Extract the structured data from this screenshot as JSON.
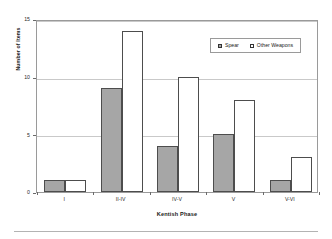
{
  "chart_data": {
    "type": "bar",
    "title": "",
    "xlabel": "Kentish Phase",
    "ylabel": "Number of Items",
    "categories": [
      "I",
      "II-IV",
      "IV-V",
      "V",
      "V-VI"
    ],
    "series": [
      {
        "name": "Spear",
        "values": [
          1,
          9,
          4,
          5,
          1
        ],
        "color": "#a6a6a6"
      },
      {
        "name": "Other Weapons",
        "values": [
          1,
          14,
          10,
          8,
          3
        ],
        "color": "#ffffff"
      }
    ],
    "ylim": [
      0,
      15
    ],
    "yticks": [
      0,
      5,
      10,
      15
    ],
    "ytick_labels": [
      "0",
      "5",
      "10",
      "15"
    ],
    "grid": true,
    "grid_axis": "y",
    "legend_position": "upper right",
    "legend_inside_plot": true,
    "orientation": "vertical",
    "bar_border_color": "#4d4d4d",
    "frame_color": "#9a9a9a",
    "gridline_color": "#c9c9c9"
  },
  "legend": {
    "entries": [
      {
        "label": "Spear",
        "swatch": "filled-gray-square"
      },
      {
        "label": "Other Weapons",
        "swatch": "hollow-white-square"
      }
    ]
  },
  "axes": {
    "y_title": "Number of Items",
    "x_title": "Kentish Phase",
    "y_tick_labels": [
      "15",
      "10",
      "5",
      "0"
    ],
    "x_tick_labels": [
      "I",
      "II-IV",
      "IV-V",
      "V",
      "V-VI"
    ]
  }
}
